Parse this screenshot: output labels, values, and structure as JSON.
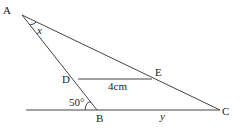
{
  "diagram": {
    "type": "geometry-triangle",
    "points": {
      "A": {
        "label": "A",
        "x": 22,
        "y": 15
      },
      "B": {
        "label": "B",
        "x": 97,
        "y": 110
      },
      "C": {
        "label": "C",
        "x": 220,
        "y": 110
      },
      "D": {
        "label": "D",
        "x": 78,
        "y": 79
      },
      "E": {
        "label": "E",
        "x": 152,
        "y": 79
      }
    },
    "labels": {
      "angle_A": "x",
      "angle_B": "50°",
      "segment_DE": "4cm",
      "segment_BC": "y"
    },
    "segments": [
      "AB",
      "AC",
      "DE",
      "BC",
      "baseline"
    ],
    "colors": {
      "line": "#444444",
      "text": "#222222",
      "background": "#ffffff"
    }
  }
}
